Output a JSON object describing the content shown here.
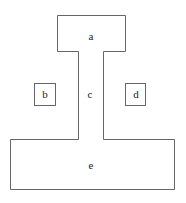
{
  "diagram": {
    "stroke_color": "#666666",
    "regions": [
      {
        "id": "a",
        "label": "a"
      },
      {
        "id": "b",
        "label": "b"
      },
      {
        "id": "c",
        "label": "c"
      },
      {
        "id": "d",
        "label": "d"
      },
      {
        "id": "e",
        "label": "e"
      }
    ]
  }
}
